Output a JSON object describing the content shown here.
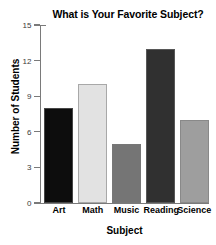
{
  "chart_data": {
    "type": "bar",
    "title": "What is Your Favorite Subject?",
    "xlabel": "Subject",
    "ylabel": "Number of Students",
    "categories": [
      "Art",
      "Math",
      "Music",
      "Reading",
      "Science"
    ],
    "values": [
      8,
      10,
      5,
      13,
      7
    ],
    "bar_colors": [
      "#0d0d0d",
      "#e2e2e2",
      "#757575",
      "#303030",
      "#9e9e9e"
    ],
    "ylim": [
      0,
      15
    ],
    "yticks": [
      0,
      3,
      6,
      9,
      12,
      15
    ],
    "ytick_labels": [
      "0",
      "3",
      "6",
      "9",
      "12",
      "15"
    ],
    "grid": false,
    "legend": false,
    "legend_position": "none",
    "axis_color": "#7a7a7a",
    "text_color": "#000000"
  }
}
